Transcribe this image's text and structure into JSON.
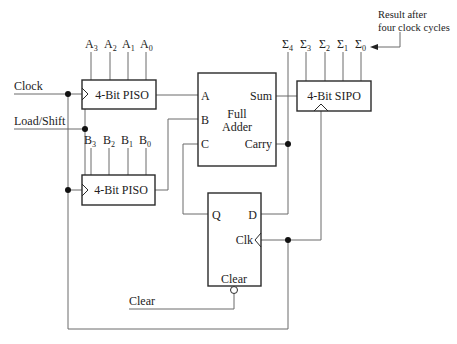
{
  "diagram": {
    "type": "serial-adder-circuit",
    "inputs": {
      "clock": "Clock",
      "load_shift": "Load/Shift",
      "clear": "Clear"
    },
    "piso_a": {
      "label": "4-Bit PISO",
      "inputs": [
        {
          "base": "A",
          "sub": "3"
        },
        {
          "base": "A",
          "sub": "2"
        },
        {
          "base": "A",
          "sub": "1"
        },
        {
          "base": "A",
          "sub": "0"
        }
      ]
    },
    "piso_b": {
      "label": "4-Bit PISO",
      "inputs": [
        {
          "base": "B",
          "sub": "3"
        },
        {
          "base": "B",
          "sub": "2"
        },
        {
          "base": "B",
          "sub": "1"
        },
        {
          "base": "B",
          "sub": "0"
        }
      ]
    },
    "full_adder": {
      "title_line1": "Full",
      "title_line2": "Adder",
      "port_a": "A",
      "port_b": "B",
      "port_c": "C",
      "port_sum": "Sum",
      "port_carry": "Carry"
    },
    "sipo": {
      "label": "4-Bit SIPO",
      "outputs": [
        {
          "base": "Σ",
          "sub": "4"
        },
        {
          "base": "Σ",
          "sub": "3"
        },
        {
          "base": "Σ",
          "sub": "2"
        },
        {
          "base": "Σ",
          "sub": "1"
        },
        {
          "base": "Σ",
          "sub": "0"
        }
      ]
    },
    "flip_flop": {
      "port_q": "Q",
      "port_d": "D",
      "port_clk": "Clk",
      "port_clear": "Clear"
    },
    "annotation": {
      "line1": "Result after",
      "line2": "four clock cycles"
    }
  }
}
